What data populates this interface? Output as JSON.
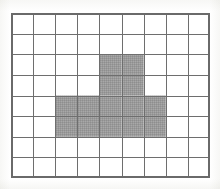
{
  "figure": {
    "grid": {
      "columns": 9,
      "rows": 8,
      "total_cells": 72,
      "shaded_count": 14,
      "unshaded_count": 58,
      "cell_width_px": 22.1,
      "cell_height_px": 20.6,
      "origin_x_px": 11,
      "origin_y_px": 13
    },
    "colors": {
      "background": "#ffffff",
      "page_tint": "#fdfdfc",
      "grid_line": "#6e6e6e",
      "grid_border": "#6a6a6a",
      "shade_fill": "#9a9a9a",
      "shade_fill_light": "#adadad",
      "shade_fill_dark": "#8a8a8a",
      "cell_empty": "#ffffff"
    },
    "shaded_cells": [
      {
        "row": 3,
        "col": 5
      },
      {
        "row": 3,
        "col": 6
      },
      {
        "row": 4,
        "col": 5
      },
      {
        "row": 4,
        "col": 6
      },
      {
        "row": 5,
        "col": 3
      },
      {
        "row": 5,
        "col": 4
      },
      {
        "row": 5,
        "col": 5
      },
      {
        "row": 5,
        "col": 6
      },
      {
        "row": 5,
        "col": 7
      },
      {
        "row": 6,
        "col": 3
      },
      {
        "row": 6,
        "col": 4
      },
      {
        "row": 6,
        "col": 5
      },
      {
        "row": 6,
        "col": 6
      },
      {
        "row": 6,
        "col": 7
      }
    ],
    "row_shading_spans": [
      {
        "row": 1,
        "first_col": null,
        "last_col": null,
        "count": 0
      },
      {
        "row": 2,
        "first_col": null,
        "last_col": null,
        "count": 0
      },
      {
        "row": 3,
        "first_col": 5,
        "last_col": 6,
        "count": 2
      },
      {
        "row": 4,
        "first_col": 5,
        "last_col": 6,
        "count": 2
      },
      {
        "row": 5,
        "first_col": 3,
        "last_col": 7,
        "count": 5
      },
      {
        "row": 6,
        "first_col": 3,
        "last_col": 7,
        "count": 5
      },
      {
        "row": 7,
        "first_col": null,
        "last_col": null,
        "count": 0
      },
      {
        "row": 8,
        "first_col": null,
        "last_col": null,
        "count": 0
      }
    ]
  }
}
